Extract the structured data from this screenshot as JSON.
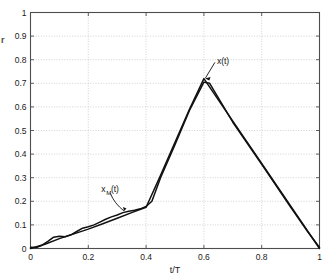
{
  "figure": {
    "background_color": "#ffffff",
    "axes_color": "#4d4d4d",
    "grid_color": "#bfbfbf",
    "curve_color": "#111111",
    "clipped_ylabel": "r"
  },
  "chart_data": {
    "type": "line",
    "title": "",
    "xlabel": "t/T",
    "ylabel": "",
    "xlim": [
      0,
      1
    ],
    "ylim": [
      0,
      1
    ],
    "grid": true,
    "grid_style": "dotted",
    "legend_position": "none",
    "xticks": [
      0,
      0.2,
      0.4,
      0.6,
      0.8,
      1
    ],
    "xtick_labels": [
      "0",
      "0.2",
      "0.4",
      "0.6",
      "0.8",
      "1"
    ],
    "yticks": [
      0,
      0.1,
      0.2,
      0.3,
      0.4,
      0.5,
      0.6,
      0.7,
      0.8,
      0.9,
      1
    ],
    "ytick_labels": [
      "0",
      "0.1",
      "0.2",
      "0.3",
      "0.4",
      "0.5",
      "0.6",
      "0.7",
      "0.8",
      "0.9",
      "1"
    ],
    "series": [
      {
        "name": "x(t)",
        "label": "x(t)",
        "color": "#111111",
        "x": [
          0,
          0.05,
          0.1,
          0.15,
          0.2,
          0.25,
          0.3,
          0.35,
          0.4,
          0.45,
          0.5,
          0.55,
          0.6,
          0.7,
          0.8,
          0.9,
          1
        ],
        "y": [
          0,
          0.018,
          0.042,
          0.062,
          0.082,
          0.105,
          0.128,
          0.152,
          0.175,
          0.31,
          0.45,
          0.59,
          0.72,
          0.54,
          0.36,
          0.18,
          0
        ]
      },
      {
        "name": "x_M(t)",
        "label": "x_M(t)",
        "color": "#111111",
        "x": [
          0,
          0.02,
          0.04,
          0.06,
          0.08,
          0.1,
          0.12,
          0.14,
          0.16,
          0.18,
          0.2,
          0.22,
          0.24,
          0.26,
          0.28,
          0.3,
          0.32,
          0.34,
          0.36,
          0.38,
          0.4,
          0.42,
          0.45,
          0.5,
          0.55,
          0.6,
          0.62,
          0.7,
          0.8,
          0.9,
          0.96,
          1
        ],
        "y": [
          0.005,
          0.004,
          0.014,
          0.03,
          0.048,
          0.052,
          0.05,
          0.058,
          0.072,
          0.086,
          0.092,
          0.1,
          0.112,
          0.124,
          0.134,
          0.142,
          0.152,
          0.158,
          0.162,
          0.168,
          0.178,
          0.2,
          0.3,
          0.44,
          0.585,
          0.705,
          0.7,
          0.535,
          0.357,
          0.175,
          0.07,
          0.004
        ]
      }
    ],
    "annotations": [
      {
        "text": "x(t)",
        "subscript": "",
        "label_x": 0.645,
        "label_y": 0.795,
        "point_x": 0.6,
        "point_y": 0.72
      },
      {
        "text": "x",
        "subscript": "M",
        "suffix": "(t)",
        "label_x": 0.245,
        "label_y": 0.255,
        "point_x": 0.325,
        "point_y": 0.155
      }
    ]
  }
}
